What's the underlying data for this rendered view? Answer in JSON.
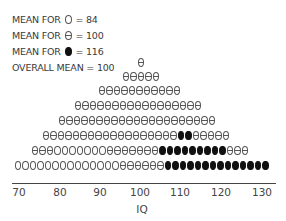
{
  "chart_data": {
    "type": "dot-plot",
    "title": "",
    "xlabel": "IQ",
    "ylabel": "",
    "xlim": [
      70,
      130
    ],
    "x_ticks": [
      "70",
      "80",
      "90",
      "100",
      "110",
      "120",
      "130"
    ],
    "legend": [
      {
        "symbol": "open-circle",
        "label": "MEAN FOR",
        "value_text": "= 84"
      },
      {
        "symbol": "theta-circle",
        "label": "MEAN FOR",
        "value_text": "= 100"
      },
      {
        "symbol": "solid-circle",
        "label": "MEAN FOR",
        "value_text": "= 116"
      },
      {
        "symbol": "",
        "label": "OVERALL MEAN",
        "value_text": "= 100"
      }
    ],
    "groups": [
      {
        "name": "open-circle",
        "mean": 84
      },
      {
        "name": "theta-circle",
        "mean": 100
      },
      {
        "name": "solid-circle",
        "mean": 116
      }
    ],
    "overall_mean": 100,
    "rows_top_to_bottom": [
      [
        {
          "t": "theta",
          "n": 1
        }
      ],
      [
        {
          "t": "theta",
          "n": 5
        }
      ],
      [
        {
          "t": "theta",
          "n": 11
        }
      ],
      [
        {
          "t": "theta",
          "n": 17
        }
      ],
      [
        {
          "t": "theta",
          "n": 21
        }
      ],
      [
        {
          "t": "theta",
          "n": 18
        },
        {
          "t": "solid",
          "n": 2
        },
        {
          "t": "theta",
          "n": 5
        }
      ],
      [
        {
          "t": "theta",
          "n": 3
        },
        {
          "t": "open",
          "n": 7
        },
        {
          "t": "theta",
          "n": 7
        },
        {
          "t": "solid",
          "n": 9
        },
        {
          "t": "theta",
          "n": 3
        }
      ],
      [
        {
          "t": "open",
          "n": 14
        },
        {
          "t": "theta",
          "n": 6
        },
        {
          "t": "solid",
          "n": 14
        }
      ]
    ],
    "row_layout": [
      {
        "y": 58,
        "x": 137
      },
      {
        "y": 72,
        "x": 122
      },
      {
        "y": 86,
        "x": 98
      },
      {
        "y": 101,
        "x": 74
      },
      {
        "y": 116,
        "x": 58
      },
      {
        "y": 131,
        "x": 42
      },
      {
        "y": 146,
        "x": 31
      },
      {
        "y": 161,
        "x": 14
      }
    ]
  },
  "legend_text": {
    "l1_label": "MEAN FOR",
    "l1_value": "= 84",
    "l2_label": "MEAN FOR",
    "l2_value": "= 100",
    "l3_label": "MEAN FOR",
    "l3_value": "= 116",
    "l4_text": "OVERALL MEAN = 100"
  },
  "axis": {
    "ticks": [
      {
        "label": "70",
        "x": 19
      },
      {
        "label": "80",
        "x": 60
      },
      {
        "label": "90",
        "x": 100
      },
      {
        "label": "100",
        "x": 140
      },
      {
        "label": "110",
        "x": 180
      },
      {
        "label": "120",
        "x": 221
      },
      {
        "label": "130",
        "x": 262
      }
    ],
    "xlabel": "IQ"
  }
}
